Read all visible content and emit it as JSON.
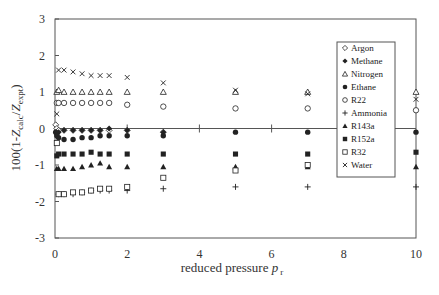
{
  "chart_data": {
    "type": "scatter",
    "title": "",
    "xlabel": "reduced pressure p_r",
    "xlabel_main": "reduced pressure ",
    "xlabel_var": "p",
    "xlabel_sub": "r",
    "ylabel": "100(1-Z_calc/Z_expt)",
    "ylabel_parts": {
      "pre": "100(1-",
      "Z1": "Z",
      "sub1": "calc",
      "slash": "/",
      "Z2": "Z",
      "sub2": "expt",
      "post": ")"
    },
    "xlim": [
      0,
      10
    ],
    "ylim": [
      -3,
      3
    ],
    "xticks": [
      0,
      2,
      4,
      6,
      8,
      10
    ],
    "yticks": [
      -3,
      -2,
      -1,
      0,
      1,
      2,
      3
    ],
    "grid": false,
    "legend_position": "upper right (inside)",
    "series": [
      {
        "name": "Argon",
        "marker": "diamond-open",
        "x": [
          0.02,
          0.05,
          0.1,
          0.25,
          0.5,
          0.75,
          1.0,
          1.25,
          1.5,
          2,
          3
        ],
        "y": [
          0.1,
          0.0,
          -0.05,
          -0.05,
          -0.05,
          -0.05,
          -0.05,
          -0.05,
          -0.05,
          -0.05,
          -0.1
        ]
      },
      {
        "name": "Methane",
        "marker": "diamond-filled",
        "x": [
          0.02,
          0.05,
          0.1,
          0.25,
          0.5,
          0.75,
          1.0,
          1.25,
          1.5,
          2,
          3
        ],
        "y": [
          -0.1,
          -0.15,
          -0.1,
          -0.05,
          -0.05,
          -0.05,
          -0.05,
          -0.05,
          0.0,
          -0.05,
          -0.1
        ]
      },
      {
        "name": "Nitrogen",
        "marker": "triangle-open",
        "x": [
          0.05,
          0.1,
          0.25,
          0.5,
          0.75,
          1.0,
          1.25,
          1.5,
          2,
          3,
          5,
          7,
          10
        ],
        "y": [
          1.0,
          1.05,
          1.0,
          1.0,
          1.0,
          1.0,
          1.0,
          1.0,
          1.0,
          1.0,
          1.0,
          1.0,
          1.0
        ]
      },
      {
        "name": "Ethane",
        "marker": "circle-filled",
        "x": [
          0.02,
          0.05,
          0.1,
          0.25,
          0.5,
          0.75,
          1.0,
          1.25,
          1.5,
          2,
          3,
          5,
          7,
          10
        ],
        "y": [
          -0.1,
          -0.2,
          -0.25,
          -0.3,
          -0.3,
          -0.25,
          -0.25,
          -0.2,
          -0.2,
          -0.2,
          -0.2,
          -0.1,
          -0.1,
          -0.1
        ]
      },
      {
        "name": "R22",
        "marker": "circle-open",
        "x": [
          0.05,
          0.1,
          0.25,
          0.5,
          0.75,
          1.0,
          1.25,
          1.5,
          2,
          3,
          5,
          7,
          10
        ],
        "y": [
          0.7,
          0.7,
          0.7,
          0.7,
          0.7,
          0.7,
          0.7,
          0.7,
          0.65,
          0.6,
          0.55,
          0.55,
          0.5
        ]
      },
      {
        "name": "Ammonia",
        "marker": "plus",
        "x": [
          0.1,
          0.25,
          0.5,
          0.75,
          1.0,
          1.25,
          1.5,
          2,
          3,
          5,
          7,
          10
        ],
        "y": [
          -1.8,
          -1.8,
          -1.8,
          -1.75,
          -1.7,
          -1.7,
          -1.7,
          -1.7,
          -1.65,
          -1.6,
          -1.6,
          -1.6
        ]
      },
      {
        "name": "R143a",
        "marker": "triangle-filled",
        "x": [
          0.05,
          0.1,
          0.25,
          0.5,
          0.75,
          1.0,
          1.25,
          1.5,
          2,
          3,
          5,
          7,
          10
        ],
        "y": [
          -1.1,
          -1.1,
          -1.1,
          -1.1,
          -1.05,
          -1.0,
          -0.95,
          -1.05,
          -1.05,
          -1.05,
          -1.05,
          -1.05,
          -1.05
        ]
      },
      {
        "name": "R152a",
        "marker": "square-filled",
        "x": [
          0.05,
          0.1,
          0.25,
          0.5,
          0.75,
          1.0,
          1.25,
          1.5,
          2,
          3,
          5,
          7,
          10
        ],
        "y": [
          -0.75,
          -0.7,
          -0.7,
          -0.7,
          -0.7,
          -0.65,
          -0.7,
          -0.7,
          -0.7,
          -0.7,
          -0.7,
          -0.7,
          -0.65
        ]
      },
      {
        "name": "R32",
        "marker": "square-open",
        "x": [
          0.05,
          0.1,
          0.25,
          0.5,
          0.75,
          1.0,
          1.25,
          1.5,
          2,
          3,
          5,
          7
        ],
        "y": [
          -0.4,
          -1.8,
          -1.8,
          -1.75,
          -1.75,
          -1.7,
          -1.65,
          -1.65,
          -1.6,
          -1.35,
          -1.15,
          -1.0
        ]
      },
      {
        "name": "Water",
        "marker": "x",
        "x": [
          0.05,
          0.1,
          0.25,
          0.5,
          0.75,
          1.0,
          1.25,
          1.5,
          2,
          3,
          5,
          7,
          10
        ],
        "y": [
          0.4,
          1.6,
          1.6,
          1.55,
          1.5,
          1.45,
          1.45,
          1.45,
          1.4,
          1.25,
          1.05,
          0.95,
          0.8
        ]
      }
    ]
  },
  "legend": {
    "items": [
      "Argon",
      "Methane",
      "Nitrogen",
      "Ethane",
      "R22",
      "Ammonia",
      "R143a",
      "R152a",
      "R32",
      "Water"
    ]
  },
  "colors": {
    "axis": "#555555",
    "marker": "#222222",
    "text": "#333333",
    "background": "#ffffff"
  }
}
